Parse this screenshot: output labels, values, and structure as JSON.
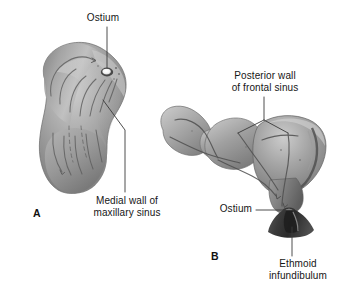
{
  "figure": {
    "background_color": "#ffffff",
    "line_color": "#3a3a3a",
    "text_color": "#161616",
    "cast_tones": {
      "highlight": "#d8d8d8",
      "midtone": "#9c9c9c",
      "shadow": "#6a6a6a",
      "deep_shadow": "#4a4a4a",
      "groove": "#5c5c5c",
      "ostium_white": "#fdfdfd"
    }
  },
  "panels": [
    {
      "letter": "A",
      "name": "maxillary-sinus-cast",
      "description": "Lateral view cast of the maxillary sinus with mucociliary flow lines converging on the ostium"
    },
    {
      "letter": "B",
      "name": "frontal-sinus-cast",
      "description": "Cast of the frontal sinus and frontal recess draining through the ostium into the ethmoid infundibulum"
    }
  ],
  "labels": {
    "ostium_a": "Ostium",
    "medial_wall": "Medial wall of\nmaxillary sinus",
    "posterior_wall": "Posterior wall\nof frontal sinus",
    "ostium_b": "Ostium",
    "ethmoid_infundibulum": "Ethmoid\ninfundibulum"
  },
  "leaders": [
    {
      "name": "leader-ostium-a",
      "type": "vertical",
      "from": [
        107,
        27
      ],
      "to": [
        107,
        70
      ]
    },
    {
      "name": "leader-medial-wall",
      "type": "elbow",
      "points": [
        [
          103,
          100
        ],
        [
          125,
          130
        ],
        [
          125,
          192
        ]
      ]
    },
    {
      "name": "leader-posterior-wall",
      "type": "fork",
      "stem": [
        [
          264,
          97
        ],
        [
          264,
          120
        ]
      ],
      "branches": [
        [
          [
            264,
            120
          ],
          [
            238,
            133
          ]
        ],
        [
          [
            264,
            120
          ],
          [
            288,
            133
          ]
        ]
      ]
    },
    {
      "name": "leader-ostium-b",
      "type": "horizontal",
      "from": [
        255,
        210
      ],
      "to": [
        295,
        210
      ]
    },
    {
      "name": "leader-ethmoid-infundibulum",
      "type": "vertical",
      "from": [
        292,
        225
      ],
      "to": [
        292,
        256
      ]
    }
  ]
}
